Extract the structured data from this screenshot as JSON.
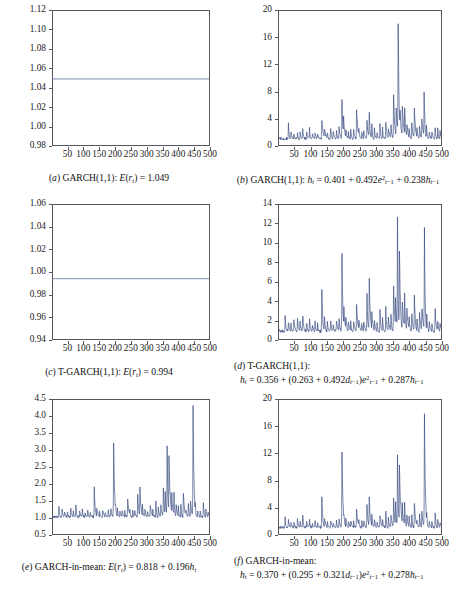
{
  "figure": {
    "panel_count": 6,
    "line_color": "#2c3f7a",
    "flat_line_color": "#7e8fb5",
    "frame_color": "#55575c"
  },
  "panels": [
    {
      "id": "a",
      "label": "(a)",
      "caption_line1": "(a) GARCH(1,1): E(r_t) = 1.049",
      "caption_html_1": "(<i>a</i>) GARCH(1,1): <i>E</i>(<i>r</i><sub><i>t</i></sub>) = 1.049",
      "caption_html_2": "",
      "yticks": [
        "0.98",
        "1.00",
        "1.02",
        "1.04",
        "1.06",
        "1.08",
        "1.10",
        "1.12"
      ],
      "ylim": [
        0.98,
        1.12
      ],
      "xticks": [
        "50",
        "100",
        "150",
        "200",
        "250",
        "300",
        "350",
        "400",
        "450",
        "500"
      ],
      "xlim": [
        1,
        500
      ],
      "series_kind": "flat",
      "flat_value": 1.049
    },
    {
      "id": "b",
      "label": "(b)",
      "caption_line1": "(b) GARCH(1,1): h_t = 0.401 + 0.492e^2_{t-1} + 0.238h_{t-1}",
      "caption_html_1": "(<i>b</i>) GARCH(1,1): <i>h</i><sub><i>t</i></sub> = 0.401 + 0.492<i>e</i><sup>2</sup><sub><i>t</i>&#8722;1</sub> + 0.238<i>h</i><sub><i>t</i>&#8722;1</sub>",
      "caption_html_2": "",
      "yticks": [
        "0",
        "4",
        "8",
        "12",
        "16",
        "20"
      ],
      "ylim": [
        0,
        20
      ],
      "xticks": [
        "50",
        "100",
        "150",
        "200",
        "250",
        "300",
        "350",
        "400",
        "450",
        "500"
      ],
      "xlim": [
        1,
        500
      ],
      "series_kind": "volatility",
      "series_ref": "h_garch"
    },
    {
      "id": "c",
      "label": "(c)",
      "caption_line1": "(c) T-GARCH(1,1): E(r_t) = 0.994",
      "caption_html_1": "(<i>c</i>) T-GARCH(1,1): <i>E</i>(<i>r</i><sub><i>t</i></sub>) = 0.994",
      "caption_html_2": "",
      "yticks": [
        "0.94",
        "0.96",
        "0.98",
        "1.00",
        "1.02",
        "1.04",
        "1.06"
      ],
      "ylim": [
        0.94,
        1.06
      ],
      "xticks": [
        "50",
        "100",
        "150",
        "200",
        "250",
        "300",
        "350",
        "400",
        "450",
        "500"
      ],
      "xlim": [
        1,
        500
      ],
      "series_kind": "flat",
      "flat_value": 0.994
    },
    {
      "id": "d",
      "label": "(d)",
      "caption_line1": "(d) T-GARCH(1,1):",
      "caption_html_1": "(<i>d</i>) T-GARCH(1,1):",
      "caption_html_2": "<i>h</i><sub><i>t</i></sub> = 0.356 + (0.263 + 0.492<i>d</i><sub><i>t</i>&#8722;1</sub>)<i>e</i><sup>2</sup><sub><i>t</i>&#8722;1</sub> + 0.287<i>h</i><sub><i>t</i>&#8722;1</sub>",
      "caption_line2": "h_t = 0.356 + (0.263 + 0.492d_{t-1})e^2_{t-1} + 0.287h_{t-1}",
      "yticks": [
        "0",
        "2",
        "4",
        "6",
        "8",
        "10",
        "12",
        "14"
      ],
      "ylim": [
        0,
        14
      ],
      "xticks": [
        "50",
        "100",
        "150",
        "200",
        "250",
        "300",
        "350",
        "400",
        "450",
        "500"
      ],
      "xlim": [
        1,
        500
      ],
      "series_kind": "volatility",
      "series_ref": "h_tgarch"
    },
    {
      "id": "e",
      "label": "(e)",
      "caption_line1": "(e) GARCH-in-mean: E(r_t) = 0.818 + 0.196h_t",
      "caption_html_1": "(<i>e</i>) GARCH-in-mean: <i>E</i>(<i>r</i><sub><i>t</i></sub>) = 0.818 + 0.196<i>h</i><sub><i>t</i></sub>",
      "caption_html_2": "",
      "yticks": [
        "0.5",
        "1.0",
        "1.5",
        "2.0",
        "2.5",
        "3.0",
        "3.5",
        "4.0",
        "4.5"
      ],
      "ylim": [
        0.5,
        4.5
      ],
      "xticks": [
        "50",
        "100",
        "150",
        "200",
        "250",
        "300",
        "350",
        "400",
        "450",
        "500"
      ],
      "xlim": [
        1,
        500
      ],
      "series_kind": "mean_in_var",
      "series_ref": "h_gim",
      "intercept": 0.818,
      "slope": 0.196
    },
    {
      "id": "f",
      "label": "(f)",
      "caption_line1": "(f) GARCH-in-mean:",
      "caption_html_1": "(<i>f</i>) GARCH-in-mean:",
      "caption_html_2": "<i>h</i><sub><i>t</i></sub> = 0.370 + (0.295 + 0.321<i>d</i><sub><i>t</i>&#8722;1</sub>)<i>e</i><sup>2</sup><sub><i>t</i>&#8722;1</sub> + 0.278<i>h</i><sub><i>t</i>&#8722;1</sub>",
      "caption_line2": "h_t = 0.370 + (0.295 + 0.321d_{t-1})e^2_{t-1} + 0.278h_{t-1}",
      "yticks": [
        "0",
        "4",
        "8",
        "12",
        "16",
        "20"
      ],
      "ylim": [
        0,
        20
      ],
      "xticks": [
        "50",
        "100",
        "150",
        "200",
        "250",
        "300",
        "350",
        "400",
        "450",
        "500"
      ],
      "xlim": [
        1,
        500
      ],
      "series_kind": "volatility",
      "series_ref": "h_gim"
    }
  ],
  "chart_data": {
    "type": "line",
    "title": "",
    "xlabel": "",
    "ylabel": "",
    "n_obs": 500,
    "shared_x": {
      "start": 1,
      "end": 500,
      "step": 1
    },
    "series": [
      {
        "name": "E(r_t) GARCH(1,1)",
        "panel": "a",
        "kind": "constant",
        "value": 1.049,
        "ylim": [
          0.98,
          1.12
        ]
      },
      {
        "name": "h_t GARCH(1,1)",
        "panel": "b",
        "kind": "conditional_variance",
        "ylim": [
          0,
          20
        ],
        "baseline": 0.72,
        "max_peak": 19.0,
        "peaks": [
          [
            30,
            3.0
          ],
          [
            38,
            2.1
          ],
          [
            47,
            1.8
          ],
          [
            58,
            2.0
          ],
          [
            66,
            1.9
          ],
          [
            74,
            2.2
          ],
          [
            86,
            2.0
          ],
          [
            95,
            2.4
          ],
          [
            104,
            1.7
          ],
          [
            112,
            2.0
          ],
          [
            120,
            1.8
          ],
          [
            133,
            4.0
          ],
          [
            141,
            2.5
          ],
          [
            150,
            1.9
          ],
          [
            160,
            2.3
          ],
          [
            168,
            1.9
          ],
          [
            178,
            2.2
          ],
          [
            186,
            2.5
          ],
          [
            195,
            6.1
          ],
          [
            200,
            4.4
          ],
          [
            207,
            2.5
          ],
          [
            215,
            2.0
          ],
          [
            222,
            2.3
          ],
          [
            231,
            2.1
          ],
          [
            240,
            5.2
          ],
          [
            247,
            2.4
          ],
          [
            256,
            2.0
          ],
          [
            262,
            2.2
          ],
          [
            272,
            3.4
          ],
          [
            279,
            4.6
          ],
          [
            287,
            2.9
          ],
          [
            295,
            2.3
          ],
          [
            303,
            2.0
          ],
          [
            312,
            3.2
          ],
          [
            320,
            2.4
          ],
          [
            330,
            3.6
          ],
          [
            338,
            2.6
          ],
          [
            346,
            3.0
          ],
          [
            354,
            7.0
          ],
          [
            362,
            5.6
          ],
          [
            368,
            19.0
          ],
          [
            374,
            5.0
          ],
          [
            381,
            6.2
          ],
          [
            388,
            6.0
          ],
          [
            395,
            3.3
          ],
          [
            402,
            2.6
          ],
          [
            410,
            3.0
          ],
          [
            418,
            5.2
          ],
          [
            426,
            2.4
          ],
          [
            434,
            3.0
          ],
          [
            441,
            4.1
          ],
          [
            448,
            8.4
          ],
          [
            455,
            3.2
          ],
          [
            464,
            2.0
          ],
          [
            472,
            1.9
          ],
          [
            482,
            2.3
          ],
          [
            490,
            2.4
          ],
          [
            497,
            2.0
          ]
        ]
      },
      {
        "name": "h_t T-GARCH(1,1)",
        "panel": "d",
        "kind": "conditional_variance",
        "ylim": [
          0,
          14
        ],
        "baseline": 0.62,
        "max_peak": 12.1,
        "peaks": [
          [
            20,
            2.2
          ],
          [
            30,
            1.9
          ],
          [
            38,
            1.6
          ],
          [
            47,
            1.8
          ],
          [
            58,
            2.0
          ],
          [
            66,
            1.7
          ],
          [
            74,
            2.6
          ],
          [
            86,
            1.8
          ],
          [
            95,
            2.0
          ],
          [
            104,
            1.5
          ],
          [
            112,
            1.8
          ],
          [
            120,
            1.6
          ],
          [
            133,
            5.2
          ],
          [
            141,
            2.3
          ],
          [
            150,
            1.7
          ],
          [
            160,
            1.9
          ],
          [
            168,
            1.5
          ],
          [
            178,
            1.9
          ],
          [
            186,
            2.1
          ],
          [
            195,
            8.9
          ],
          [
            201,
            3.1
          ],
          [
            207,
            2.3
          ],
          [
            215,
            1.8
          ],
          [
            222,
            2.0
          ],
          [
            231,
            1.9
          ],
          [
            240,
            3.4
          ],
          [
            247,
            2.0
          ],
          [
            256,
            1.7
          ],
          [
            262,
            1.9
          ],
          [
            272,
            4.6
          ],
          [
            279,
            5.8
          ],
          [
            287,
            2.6
          ],
          [
            295,
            2.1
          ],
          [
            303,
            1.8
          ],
          [
            312,
            2.8
          ],
          [
            320,
            2.1
          ],
          [
            330,
            3.1
          ],
          [
            338,
            2.3
          ],
          [
            346,
            2.6
          ],
          [
            354,
            5.0
          ],
          [
            360,
            4.6
          ],
          [
            366,
            11.9
          ],
          [
            372,
            10.1
          ],
          [
            381,
            4.1
          ],
          [
            388,
            4.4
          ],
          [
            395,
            2.9
          ],
          [
            402,
            2.3
          ],
          [
            410,
            2.6
          ],
          [
            418,
            4.6
          ],
          [
            426,
            2.1
          ],
          [
            434,
            2.6
          ],
          [
            441,
            3.4
          ],
          [
            449,
            12.1
          ],
          [
            456,
            2.8
          ],
          [
            464,
            1.8
          ],
          [
            472,
            1.6
          ],
          [
            482,
            3.1
          ],
          [
            490,
            2.0
          ],
          [
            497,
            1.7
          ]
        ]
      },
      {
        "name": "h_t GARCH-in-mean",
        "panel": "f",
        "kind": "conditional_variance",
        "ylim": [
          0,
          20
        ],
        "baseline": 0.75,
        "max_peak": 16.5,
        "peaks": [
          [
            20,
            2.4
          ],
          [
            30,
            2.0
          ],
          [
            38,
            1.7
          ],
          [
            47,
            1.9
          ],
          [
            58,
            2.1
          ],
          [
            66,
            1.8
          ],
          [
            74,
            3.1
          ],
          [
            86,
            1.9
          ],
          [
            95,
            2.2
          ],
          [
            104,
            1.6
          ],
          [
            112,
            1.9
          ],
          [
            120,
            1.7
          ],
          [
            133,
            5.3
          ],
          [
            141,
            2.4
          ],
          [
            150,
            1.8
          ],
          [
            160,
            2.0
          ],
          [
            168,
            1.6
          ],
          [
            178,
            2.0
          ],
          [
            186,
            2.2
          ],
          [
            195,
            11.0
          ],
          [
            201,
            3.2
          ],
          [
            207,
            2.4
          ],
          [
            215,
            1.9
          ],
          [
            222,
            2.1
          ],
          [
            231,
            2.0
          ],
          [
            240,
            3.6
          ],
          [
            247,
            2.1
          ],
          [
            256,
            1.8
          ],
          [
            262,
            2.0
          ],
          [
            272,
            4.4
          ],
          [
            279,
            5.2
          ],
          [
            287,
            2.7
          ],
          [
            295,
            2.2
          ],
          [
            303,
            1.9
          ],
          [
            312,
            3.0
          ],
          [
            320,
            2.2
          ],
          [
            330,
            3.3
          ],
          [
            338,
            2.4
          ],
          [
            346,
            2.7
          ],
          [
            354,
            5.4
          ],
          [
            360,
            4.8
          ],
          [
            366,
            11.5
          ],
          [
            372,
            9.4
          ],
          [
            381,
            4.3
          ],
          [
            388,
            4.6
          ],
          [
            395,
            3.0
          ],
          [
            402,
            2.4
          ],
          [
            410,
            2.8
          ],
          [
            418,
            4.8
          ],
          [
            426,
            2.2
          ],
          [
            434,
            2.7
          ],
          [
            441,
            3.6
          ],
          [
            449,
            16.5
          ],
          [
            456,
            3.0
          ],
          [
            464,
            1.9
          ],
          [
            472,
            1.7
          ],
          [
            482,
            3.3
          ],
          [
            490,
            2.1
          ],
          [
            497,
            1.8
          ]
        ]
      },
      {
        "name": "E(r_t) T-GARCH(1,1)",
        "panel": "c",
        "kind": "constant",
        "value": 0.994,
        "ylim": [
          0.94,
          1.06
        ]
      },
      {
        "name": "E(r_t) GARCH-in-mean",
        "panel": "e",
        "kind": "linear_in_h",
        "intercept": 0.818,
        "slope": 0.196,
        "source_series": "h_t GARCH-in-mean",
        "ylim": [
          0.5,
          4.5
        ]
      }
    ]
  }
}
